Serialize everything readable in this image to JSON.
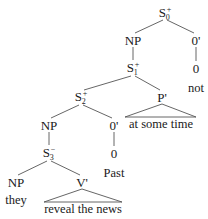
{
  "tree": {
    "nodes": {
      "s0": {
        "base": "S",
        "sub": "0",
        "sup": "+"
      },
      "np1": {
        "label": "NP"
      },
      "o1p": {
        "label": "0'"
      },
      "s1": {
        "base": "S",
        "sub": "1",
        "sup": "+"
      },
      "o1": {
        "label": "0"
      },
      "s2": {
        "base": "S",
        "sub": "2",
        "sup": "+"
      },
      "pp": {
        "label": "P'"
      },
      "np2": {
        "label": "NP"
      },
      "o2p": {
        "label": "0'"
      },
      "s3": {
        "base": "S",
        "sub": "3",
        "sup": "−"
      },
      "o2": {
        "label": "0"
      },
      "np3": {
        "label": "NP"
      },
      "vp": {
        "label": "V'"
      }
    },
    "leaves": {
      "not": "not",
      "at_some_time": "at some time",
      "past": "Past",
      "they": "they",
      "reveal_the_news": "reveal the news"
    }
  }
}
